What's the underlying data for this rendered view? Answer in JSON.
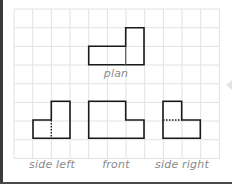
{
  "figure": {
    "grid": {
      "origin_x": 14,
      "origin_y": 9,
      "cell": 18.67,
      "cols": 11,
      "rows": 8,
      "line_color": "#e2e2e2"
    },
    "shape_stroke": "#1a1a1a",
    "views": [
      {
        "name": "plan",
        "label": "plan"
      },
      {
        "name": "side-left",
        "label": "side left"
      },
      {
        "name": "front",
        "label": "front"
      },
      {
        "name": "side-right",
        "label": "side right"
      }
    ]
  }
}
